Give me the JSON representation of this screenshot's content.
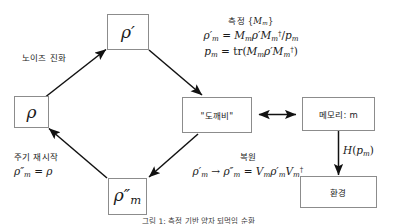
{
  "diagram": {
    "title_caption": "그림 1: 측정 기반 양자 되먹임 순환",
    "colors": {
      "box_border": "#8c8c8c",
      "arrow": "#111111",
      "text": "#1a1a1a",
      "background": "#ffffff"
    },
    "nodes": [
      {
        "id": "rho",
        "label": "ρ",
        "kind": "math-state"
      },
      {
        "id": "rho_prime",
        "label": "ρ′",
        "kind": "math-state"
      },
      {
        "id": "demon",
        "label": "\"도깨비\"",
        "kind": "korean-box"
      },
      {
        "id": "memory",
        "label": "메모리: m",
        "kind": "korean-box"
      },
      {
        "id": "environment",
        "label": "환경",
        "kind": "korean-box"
      },
      {
        "id": "rho_double_prime_m",
        "label": "ρ″m",
        "kind": "math-state"
      }
    ],
    "edge_labels": {
      "noise_evolution": "노이즈 진화",
      "cycle_restart_title": "주기 재시작",
      "cycle_restart_equation": "ρ″m = ρ",
      "measurement_title": "측정 {Mm}",
      "measurement_eq1": "ρ′m = Mm ρ′ Mm† / pm",
      "measurement_eq2": "pm = tr(Mm ρ′ Mm†)",
      "recovery_title": "복원",
      "recovery_equation": "ρ′m → ρ″m = Vm ρ′m Vm†",
      "entropy_cost": "H(pm)"
    }
  }
}
